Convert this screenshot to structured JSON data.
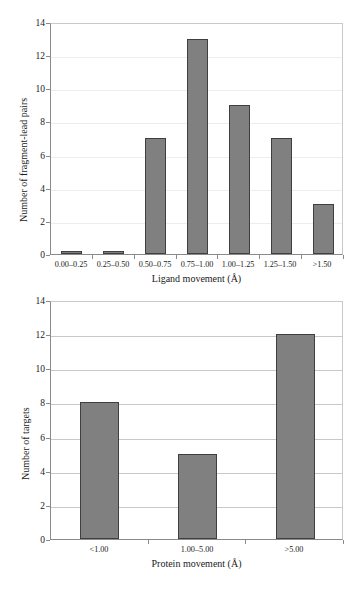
{
  "figure": {
    "background": "#ffffff",
    "bar_fill": "#808080",
    "bar_stroke": "#3f3f3f",
    "axis_color": "#8a8a8a",
    "grid_color": "#c8c8c8"
  },
  "chart_data": [
    {
      "id": "ligand-movement-histogram",
      "type": "bar",
      "title": "",
      "xlabel": "Ligand movement (Å)",
      "ylabel": "Number of fragment-lead pairs",
      "categories": [
        "0.00–0.25",
        "0.25–0.50",
        "0.50–0.75",
        "0.75–1.00",
        "1.00–1.25",
        "1.25–1.50",
        ">1.50"
      ],
      "values": [
        0,
        0,
        7,
        13,
        9,
        7,
        3
      ],
      "ylim": [
        0,
        14
      ],
      "yticks": [
        0,
        2,
        4,
        6,
        8,
        10,
        12,
        14
      ],
      "ytick_labels": [
        "0",
        "2",
        "4",
        "6",
        "8",
        "10",
        "12",
        "14"
      ],
      "grid": true,
      "grid_axis": "y",
      "legend": null,
      "legend_position": "none"
    },
    {
      "id": "protein-movement-histogram",
      "type": "bar",
      "title": "",
      "xlabel": "Protein movement (Å)",
      "ylabel": "Number of targets",
      "categories": [
        "<1.00",
        "1.00–5.00",
        ">5.00"
      ],
      "values": [
        8,
        5,
        12
      ],
      "ylim": [
        0,
        14
      ],
      "yticks": [
        0,
        2,
        4,
        6,
        8,
        10,
        12,
        14
      ],
      "ytick_labels": [
        "0",
        "2",
        "4",
        "6",
        "8",
        "10",
        "12",
        "14"
      ],
      "grid": true,
      "grid_axis": "y",
      "legend": null,
      "legend_position": "none"
    }
  ]
}
